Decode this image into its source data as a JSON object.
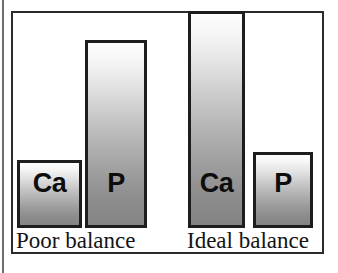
{
  "figure": {
    "alt_title": "Calcium and phosphorus balance comparison"
  },
  "chart_data": {
    "type": "bar",
    "title": "",
    "subtitle": "",
    "xlabel": "",
    "ylabel": "",
    "grid": false,
    "legend": "none",
    "ylim": [
      0,
      100
    ],
    "groups": [
      {
        "name": "Poor balance",
        "label": "Poor balance",
        "bars": [
          {
            "label": "Ca",
            "value": 30
          },
          {
            "label": "P",
            "value": 83
          }
        ]
      },
      {
        "name": "Ideal balance",
        "label": "Ideal balance",
        "bars": [
          {
            "label": "Ca",
            "value": 96
          },
          {
            "label": "P",
            "value": 34
          }
        ]
      }
    ],
    "categories": [
      "Poor balance",
      "Ideal balance"
    ],
    "series": [
      {
        "name": "Ca",
        "values": [
          30,
          96
        ]
      },
      {
        "name": "P",
        "values": [
          83,
          34
        ]
      }
    ],
    "annotations": [],
    "colors": {
      "bar_outline": "#1d1d1d",
      "bar_gradient_top": "#fdfdfd",
      "bar_gradient_bottom": "#848484",
      "panel_border": "#2b2b2b",
      "background": "#ffffff",
      "text": "#141414"
    }
  }
}
